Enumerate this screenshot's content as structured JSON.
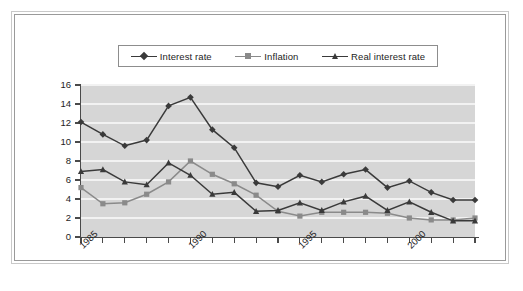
{
  "chart_data": {
    "type": "line",
    "title": "",
    "xlabel": "",
    "ylabel": "",
    "x": [
      1985,
      1986,
      1987,
      1988,
      1989,
      1990,
      1991,
      1992,
      1993,
      1994,
      1995,
      1996,
      1997,
      1998,
      1999,
      2000,
      2001,
      2002,
      2003
    ],
    "xlim": [
      1985,
      2003
    ],
    "ylim": [
      0,
      16
    ],
    "ytick_labels": [
      "0",
      "2",
      "4",
      "6",
      "8",
      "10",
      "12",
      "14",
      "16"
    ],
    "ytick_values": [
      0,
      2,
      4,
      6,
      8,
      10,
      12,
      14,
      16
    ],
    "xtick_labels": [
      "1985",
      "1990",
      "1995",
      "2000"
    ],
    "xtick_values": [
      1985,
      1990,
      1995,
      2000
    ],
    "grid": "horizontal",
    "legend_position": "top-center",
    "series": [
      {
        "name": "Interest rate",
        "marker": "diamond",
        "color": "#3a3a3a",
        "values": [
          12.1,
          10.8,
          9.6,
          10.2,
          13.8,
          14.7,
          11.3,
          9.4,
          5.7,
          5.3,
          6.5,
          5.8,
          6.6,
          7.1,
          5.2,
          5.9,
          4.7,
          3.9,
          3.9
        ]
      },
      {
        "name": "Inflation",
        "marker": "square",
        "color": "#8a8a8a",
        "values": [
          5.2,
          3.5,
          3.6,
          4.5,
          5.8,
          8.0,
          6.6,
          5.6,
          4.4,
          2.7,
          2.2,
          2.6,
          2.6,
          2.6,
          2.5,
          2.0,
          1.8,
          1.8,
          2.0
        ]
      },
      {
        "name": "Real interest rate",
        "marker": "triangle",
        "color": "#3a3a3a",
        "values": [
          6.9,
          7.1,
          5.8,
          5.5,
          7.8,
          6.5,
          4.5,
          4.7,
          2.7,
          2.8,
          3.6,
          2.8,
          3.7,
          4.3,
          2.8,
          3.7,
          2.6,
          1.7,
          1.7
        ]
      }
    ]
  },
  "legend": {
    "items": [
      {
        "label": "Interest rate",
        "marker": "diamond",
        "color": "#3a3a3a"
      },
      {
        "label": "Inflation",
        "marker": "square",
        "color": "#8a8a8a"
      },
      {
        "label": "Real interest rate",
        "marker": "triangle",
        "color": "#3a3a3a"
      }
    ]
  },
  "colors": {
    "plot_background": "#d6d6d6",
    "gridline": "#f2f2f2",
    "axis": "#4a4a4a",
    "frame": "#9a9a9a",
    "series_dark": "#3a3a3a",
    "series_gray": "#8a8a8a"
  }
}
